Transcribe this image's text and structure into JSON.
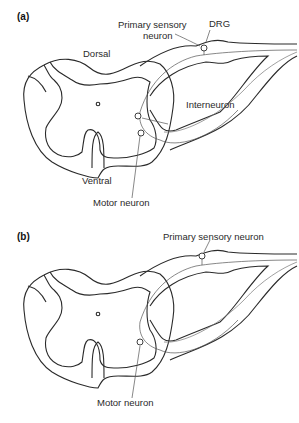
{
  "panels": [
    {
      "id": "a",
      "letter": "(a)",
      "labels": {
        "primary_sensory_line1": "Primary sensory",
        "primary_sensory_line2": "neuron",
        "drg": "DRG",
        "dorsal": "Dorsal",
        "interneuron": "Interneuron",
        "ventral": "Ventral",
        "motor_neuron": "Motor neuron"
      }
    },
    {
      "id": "b",
      "letter": "(b)",
      "labels": {
        "primary_sensory": "Primary sensory neuron",
        "motor_neuron": "Motor neuron"
      }
    }
  ],
  "colors": {
    "outline": "#2a2a2a",
    "neuron_path": "#666666",
    "background": "#ffffff"
  }
}
